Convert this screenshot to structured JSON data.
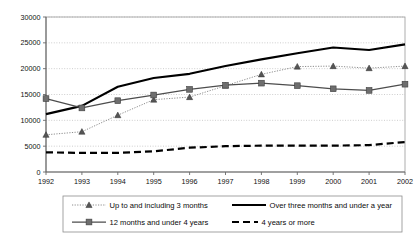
{
  "chart_data": {
    "type": "line",
    "title": "",
    "subtitle": "",
    "xlabel": "",
    "ylabel": "",
    "x": [
      1992,
      1993,
      1994,
      1995,
      1996,
      1997,
      1998,
      1999,
      2000,
      2001,
      2002
    ],
    "categories": [
      "1992",
      "1993",
      "1994",
      "1995",
      "1996",
      "1997",
      "1998",
      "1999",
      "2000",
      "2001",
      "2002"
    ],
    "ylim": [
      0,
      30000
    ],
    "ytick_values": [
      0,
      5000,
      10000,
      15000,
      20000,
      25000,
      30000
    ],
    "ytick_labels": [
      "0",
      "5000",
      "10000",
      "15000",
      "20000",
      "25000",
      "30000"
    ],
    "grid": "horizontal-dotted",
    "legend_position": "bottom",
    "series": [
      {
        "name": "Up to and including 3 months",
        "marker": "triangle",
        "line_style": "dotted",
        "color": "#808080",
        "marker_color": "#555555",
        "values": [
          7200,
          7800,
          11000,
          14000,
          14500,
          16700,
          18900,
          20400,
          20500,
          20100,
          20500
        ]
      },
      {
        "name": "Over three months and under a year",
        "marker": "none",
        "line_style": "solid",
        "color": "#000000",
        "marker_color": "#000000",
        "values": [
          11200,
          12800,
          16500,
          18200,
          19000,
          20500,
          21800,
          23000,
          24100,
          23600,
          24700
        ]
      },
      {
        "name": "12 months and under 4 years",
        "marker": "square",
        "line_style": "solid",
        "color": "#4d4d4d",
        "marker_color": "#6e6e6e",
        "values": [
          14200,
          12400,
          13800,
          14900,
          16000,
          16800,
          17200,
          16700,
          16100,
          15800,
          17000
        ]
      },
      {
        "name": "4 years or more",
        "marker": "none",
        "line_style": "dashed",
        "color": "#000000",
        "marker_color": "#000000",
        "values": [
          3800,
          3700,
          3700,
          4000,
          4700,
          5000,
          5100,
          5100,
          5100,
          5200,
          5800
        ]
      }
    ],
    "legend": [
      {
        "label": "Up to and including 3 months",
        "marker": "triangle",
        "line_style": "dotted",
        "color": "#808080"
      },
      {
        "label": "Over three months and under a year",
        "marker": "none",
        "line_style": "solid",
        "color": "#000000"
      },
      {
        "label": "12 months and under 4 years",
        "marker": "square",
        "line_style": "solid",
        "color": "#4d4d4d"
      },
      {
        "label": "4 years or more",
        "marker": "none",
        "line_style": "dashed",
        "color": "#000000"
      }
    ]
  }
}
